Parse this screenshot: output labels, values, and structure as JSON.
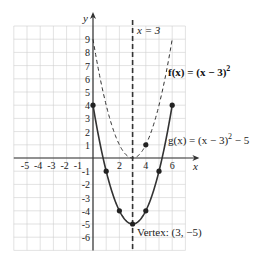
{
  "chart_data": {
    "type": "line",
    "title": "",
    "xlabel": "x",
    "ylabel": "y",
    "xlim": [
      -6,
      7
    ],
    "ylim": [
      -7,
      10
    ],
    "grid": true,
    "x_tick_labels": [
      "-5",
      "-4",
      "-3",
      "-2",
      "-1",
      "2",
      "4",
      "6"
    ],
    "x_tick_values": [
      -5,
      -4,
      -3,
      -2,
      -1,
      2,
      4,
      6
    ],
    "y_tick_labels": [
      "1",
      "2",
      "3",
      "4",
      "5",
      "6",
      "7",
      "8",
      "9",
      "-1",
      "-2",
      "-3",
      "-4",
      "-5",
      "-6"
    ],
    "y_tick_values": [
      1,
      2,
      3,
      4,
      5,
      6,
      7,
      8,
      9,
      -1,
      -2,
      -3,
      -4,
      -5,
      -6
    ],
    "series": [
      {
        "name": "f(x) = (x − 3)²",
        "style": "dashed",
        "formula": {
          "h": 3,
          "k": 0
        },
        "x_range": [
          0.0,
          6.0
        ],
        "points": [
          {
            "x": 4,
            "y": 1
          }
        ]
      },
      {
        "name": "g(x) = (x − 3)² − 5",
        "style": "solid",
        "formula": {
          "h": 3,
          "k": -5
        },
        "x_range": [
          0.0,
          6.0
        ],
        "points": [
          {
            "x": 0,
            "y": 4
          },
          {
            "x": 1,
            "y": -1
          },
          {
            "x": 2,
            "y": -4
          },
          {
            "x": 3,
            "y": -5
          },
          {
            "x": 4,
            "y": -4
          },
          {
            "x": 5,
            "y": -1
          },
          {
            "x": 6,
            "y": 4
          }
        ]
      }
    ],
    "annotations": {
      "axis_of_symmetry": {
        "label": "x = 3",
        "x": 3
      },
      "f_label": "f(x) = (x − 3)",
      "f_label_exp": "2",
      "g_label": "g(x) = (x − 3)",
      "g_label_exp": "2",
      "g_label_tail": " − 5",
      "vertex_label": "Vertex: (3, −5)"
    }
  }
}
